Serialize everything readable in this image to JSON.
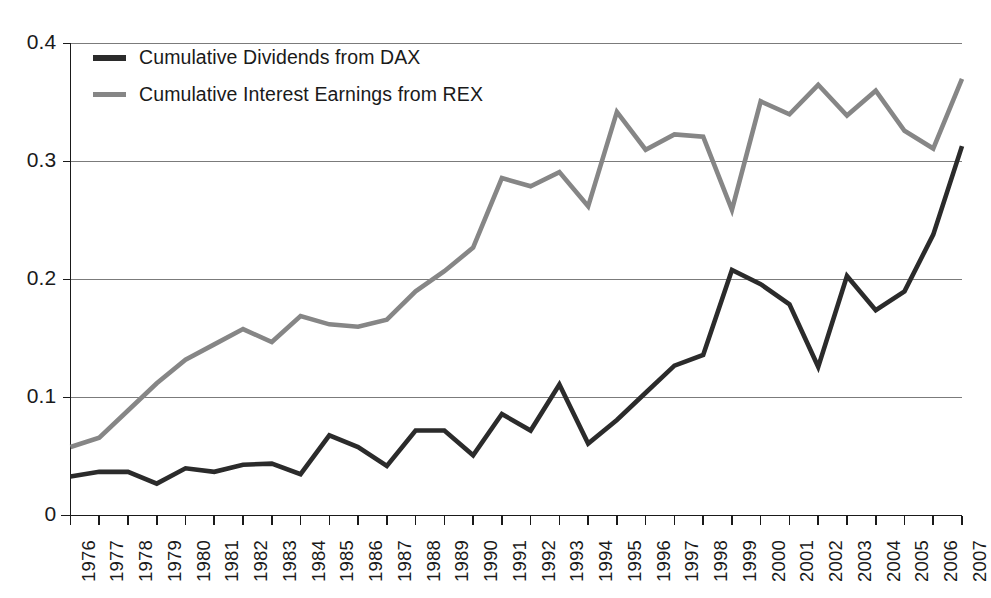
{
  "chart_data": {
    "type": "line",
    "title": "",
    "subtitle": "",
    "xlabel": "",
    "ylabel": "",
    "xlim": [
      1976,
      2007
    ],
    "ylim": [
      0,
      0.4
    ],
    "grid": true,
    "legend_position": "top-left",
    "yticks": [
      "0",
      "0.1",
      "0.2",
      "0.3",
      "0.4"
    ],
    "ytick_values": [
      0,
      0.1,
      0.2,
      0.3,
      0.4
    ],
    "categories": [
      "1976",
      "1977",
      "1978",
      "1979",
      "1980",
      "1981",
      "1982",
      "1983",
      "1984",
      "1985",
      "1986",
      "1987",
      "1988",
      "1989",
      "1990",
      "1991",
      "1992",
      "1993",
      "1994",
      "1995",
      "1996",
      "1997",
      "1998",
      "1999",
      "2000",
      "2001",
      "2002",
      "2003",
      "2004",
      "2005",
      "2006",
      "2007"
    ],
    "series": [
      {
        "name": "Cumulative Dividends from DAX",
        "color": "#2b2b2b",
        "width": 4.6,
        "values": [
          0.033,
          0.037,
          0.037,
          0.027,
          0.04,
          0.037,
          0.043,
          0.044,
          0.035,
          0.068,
          0.058,
          0.042,
          0.072,
          0.072,
          0.051,
          0.086,
          0.072,
          0.111,
          0.061,
          0.081,
          0.104,
          0.127,
          0.136,
          0.208,
          0.196,
          0.179,
          0.126,
          0.203,
          0.174,
          0.19,
          0.238,
          0.313
        ]
      },
      {
        "name": "Cumulative Interest Earnings from REX",
        "color": "#868686",
        "width": 4.6,
        "values": [
          0.058,
          0.066,
          0.089,
          0.112,
          0.132,
          0.145,
          0.158,
          0.147,
          0.169,
          0.162,
          0.16,
          0.166,
          0.19,
          0.207,
          0.227,
          0.286,
          0.279,
          0.291,
          0.262,
          0.342,
          0.31,
          0.323,
          0.321,
          0.259,
          0.351,
          0.34,
          0.365,
          0.339,
          0.36,
          0.326,
          0.311,
          0.37
        ]
      }
    ]
  },
  "legend": {
    "items": [
      {
        "label": "Cumulative Dividends from DAX",
        "color": "#2b2b2b"
      },
      {
        "label": "Cumulative Interest Earnings from REX",
        "color": "#868686"
      }
    ]
  }
}
